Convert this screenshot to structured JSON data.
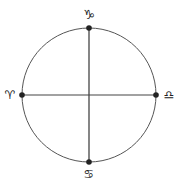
{
  "diagram": {
    "type": "zodiac-cross-circle",
    "circle": {
      "cx": 89,
      "cy": 95,
      "r": 67,
      "stroke": "#555555"
    },
    "axes": {
      "vertical": {
        "x1": 89,
        "y1": 28,
        "x2": 89,
        "y2": 162
      },
      "horizontal": {
        "x1": 22,
        "y1": 95,
        "x2": 156,
        "y2": 95
      }
    },
    "points": [
      {
        "name": "capricorn",
        "position": "top",
        "symbol": "♑",
        "cx": 89,
        "cy": 28,
        "lx": 89,
        "ly": 19
      },
      {
        "name": "aries",
        "position": "left",
        "symbol": "♈",
        "cx": 22,
        "cy": 95,
        "lx": 10,
        "ly": 99
      },
      {
        "name": "libra",
        "position": "right",
        "symbol": "♎",
        "cx": 156,
        "cy": 95,
        "lx": 169,
        "ly": 99
      },
      {
        "name": "cancer",
        "position": "bottom",
        "symbol": "♋",
        "cx": 89,
        "cy": 162,
        "lx": 89,
        "ly": 178
      }
    ],
    "colors": {
      "line": "#444444",
      "dot": "#222222",
      "glyph": "#222222"
    }
  }
}
